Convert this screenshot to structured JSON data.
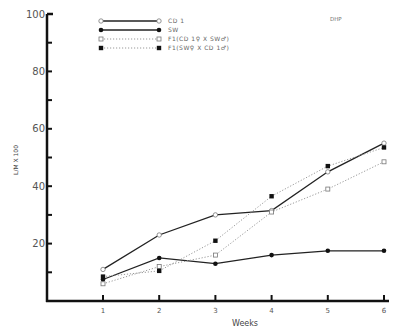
{
  "chart_data": {
    "type": "line",
    "title": "",
    "annotation": "DHP",
    "xlabel": "Weeks",
    "ylabel": "L/M X 100",
    "x": [
      1,
      2,
      3,
      4,
      5,
      6
    ],
    "x_tick_labels": [
      "1",
      "2",
      "3",
      "4",
      "5",
      "6"
    ],
    "ylim": [
      0,
      100
    ],
    "y_tick_labels": [
      "20",
      "40",
      "60",
      "80",
      "100"
    ],
    "y_major_ticks": [
      20,
      40,
      60,
      80,
      100
    ],
    "y_minor_ticks": [
      10,
      30,
      50,
      70,
      90
    ],
    "grid": false,
    "legend_position": "top-center",
    "series": [
      {
        "name": "CD 1",
        "line": "solid",
        "marker": "open-circle",
        "values": [
          11,
          23,
          30,
          31.5,
          45,
          55
        ]
      },
      {
        "name": "SW",
        "line": "solid",
        "marker": "filled-circle",
        "values": [
          7.5,
          15,
          13,
          16,
          17.5,
          17.5
        ]
      },
      {
        "name": "F1(CD 1♀ X SW♂)",
        "line": "dotted",
        "marker": "open-square",
        "values": [
          6,
          12,
          16,
          31,
          39,
          48.5
        ]
      },
      {
        "name": "F1(SW♀ X CD 1♂)",
        "line": "dotted",
        "marker": "filled-square",
        "values": [
          8.5,
          10.5,
          21,
          36.5,
          47,
          53.5
        ]
      }
    ]
  }
}
